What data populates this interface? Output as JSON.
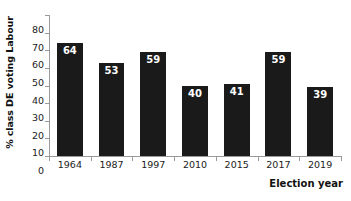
{
  "chart_data": {
    "type": "bar",
    "title": "",
    "subtitle": "",
    "categories": [
      "1964",
      "1987",
      "1997",
      "2010",
      "2015",
      "2017",
      "2019"
    ],
    "values": [
      64,
      53,
      59,
      40,
      41,
      59,
      39
    ],
    "xlabel": "Election year",
    "ylabel": "% class DE voting Labour",
    "ylim": [
      0,
      80
    ],
    "ytick_step": 10,
    "yticks": [
      "80",
      "70",
      "60",
      "50",
      "40",
      "30",
      "20",
      "10",
      "0"
    ],
    "grid": false,
    "legend": null,
    "annotations": [],
    "bar_color": "#1a1a1a",
    "value_label_color": "#ffffff",
    "axis_color": "#9a9a9a",
    "background_color": "#ffffff"
  }
}
